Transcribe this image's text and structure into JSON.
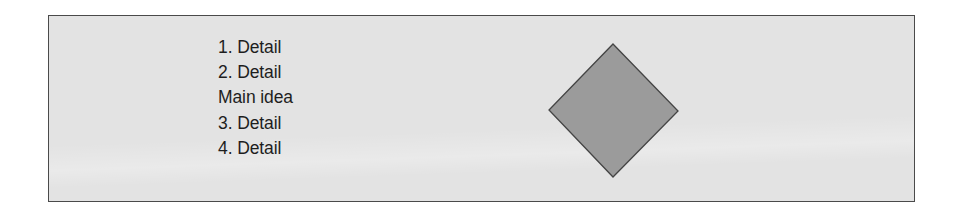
{
  "diagram": {
    "list_items": [
      "1. Detail",
      "2. Detail",
      "Main idea",
      "3. Detail",
      "4. Detail"
    ],
    "shape": {
      "type": "diamond",
      "fill": "#9b9b9b",
      "stroke": "#444444"
    },
    "colors": {
      "background": "#e3e3e3",
      "border": "#4a4a4a",
      "text": "#1e1e1e"
    }
  }
}
